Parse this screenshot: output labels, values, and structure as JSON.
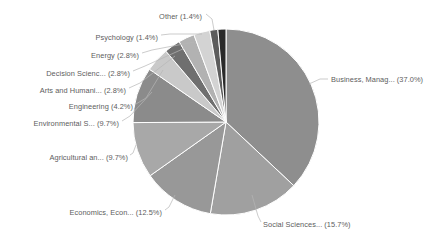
{
  "chart_data": {
    "type": "pie",
    "title": "",
    "subtitle": "",
    "xlabel": "",
    "ylabel": "",
    "legend_position": "none",
    "grid": false,
    "start_angle_deg": 0,
    "direction": "clockwise",
    "categories": [
      "Business, Manag...",
      "Social Sciences...",
      "Economics, Econ...",
      "Agricultural an...",
      "Environmental S...",
      "Engineering",
      "Arts and Humani...",
      "Decision Scienc...",
      "Energy",
      "Psychology",
      "Other"
    ],
    "values": [
      37.0,
      15.7,
      12.5,
      9.7,
      9.7,
      4.2,
      2.8,
      2.8,
      2.8,
      1.4,
      1.4
    ],
    "value_unit": "%",
    "colors": [
      "#8e8e8e",
      "#a0a0a0",
      "#989898",
      "#a8a8a8",
      "#8b8b8b",
      "#c9c9c9",
      "#6f6f6f",
      "#b2b2b2",
      "#d3d3d3",
      "#5c5c5c",
      "#2a2a2a"
    ],
    "labels": [
      {
        "id": "business",
        "text": "Business, Manag... (37.0%)",
        "category": "Business, Manag...",
        "value": 37.0,
        "x": 331,
        "y": 80,
        "anchor": "start",
        "leader": "M 309,84 L 320,79 L 328,79"
      },
      {
        "id": "social-sciences",
        "text": "Social Sciences... (15.7%)",
        "category": "Social Sciences...",
        "value": 15.7,
        "x": 263,
        "y": 225,
        "anchor": "start",
        "leader": "M 252,195 L 258,216 L 261,222"
      },
      {
        "id": "economics",
        "text": "Economics, Econ... (12.5%)",
        "category": "Economics, Econ...",
        "value": 12.5,
        "x": 162,
        "y": 213,
        "anchor": "end",
        "leader": "M 175,195 L 169,207 L 165,210"
      },
      {
        "id": "agricultural",
        "text": "Agricultural an... (9.7%)",
        "category": "Agricultural an...",
        "value": 9.7,
        "x": 128,
        "y": 158,
        "anchor": "end",
        "leader": "M 136,145 L 133,153 L 130,155"
      },
      {
        "id": "environmental",
        "text": "Environmental S... (9.7%)",
        "category": "Environmental S...",
        "value": 9.7,
        "x": 119,
        "y": 124,
        "anchor": "end",
        "leader": "M 152,92 L 130,116 L 122,121"
      },
      {
        "id": "engineering",
        "text": "Engineering (4.2%)",
        "category": "Engineering",
        "value": 4.2,
        "x": 133,
        "y": 107,
        "anchor": "end",
        "leader": "M 163,70 L 146,98 L 136,104"
      },
      {
        "id": "arts-humanities",
        "text": "Arts and Humani... (2.8%)",
        "category": "Arts and Humani...",
        "value": 2.8,
        "x": 126,
        "y": 91,
        "anchor": "end",
        "leader": "M 175,56 L 140,83 L 129,88"
      },
      {
        "id": "decision-sciences",
        "text": "Decision Scienc... (2.8%)",
        "category": "Decision Scienc...",
        "value": 2.8,
        "x": 130,
        "y": 74,
        "anchor": "end",
        "leader": "M 185,48 L 145,66 L 133,71"
      },
      {
        "id": "energy",
        "text": "Energy (2.8%)",
        "category": "Energy",
        "value": 2.8,
        "x": 139,
        "y": 56,
        "anchor": "end",
        "leader": "M 194,42 L 152,50 L 142,53"
      },
      {
        "id": "psychology",
        "text": "Psychology (1.4%)",
        "category": "Psychology",
        "value": 1.4,
        "x": 158,
        "y": 38,
        "anchor": "end",
        "leader": "M 202,34 L 170,34 L 161,35"
      },
      {
        "id": "other",
        "text": "Other (1.4%)",
        "category": "Other",
        "value": 1.4,
        "x": 202,
        "y": 17,
        "anchor": "end",
        "leader": "M 214,30 L 212,19 L 206,14"
      }
    ]
  },
  "geometry": {
    "cx": 226,
    "cy": 122,
    "r": 93
  }
}
